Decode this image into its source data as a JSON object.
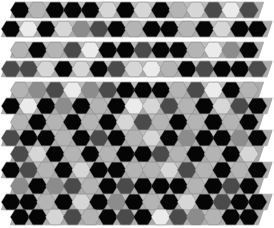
{
  "palette": {
    "K": "#050505",
    "D": "#4a4a4a",
    "G": "#8c8c8c",
    "L": "#b4b4b4",
    "V": "#d6d6d6",
    "W": "#ebebeb",
    "triangle": "#ababab",
    "edge": "#9a9a9a",
    "background": "#ffffff"
  },
  "geometry": {
    "hex_pitch": 17.6,
    "hex_radius": 9.6,
    "row_heights": 16
  },
  "strips": [
    {
      "y": 10,
      "x0": 20,
      "gap_after": true,
      "hexes": [
        "K",
        "L",
        "K",
        "K",
        "K",
        "V",
        "K",
        "V",
        "K",
        "L",
        "V",
        "D",
        "W",
        "D"
      ]
    },
    {
      "y": 29,
      "x0": 11,
      "gap_after": true,
      "hexes": [
        "K",
        "W",
        "K",
        "V",
        "G",
        "D",
        "K",
        "L",
        "K",
        "K",
        "L",
        "K",
        "V",
        "K",
        "K"
      ]
    },
    {
      "y": 50,
      "x0": 20,
      "gap_after": true,
      "hexes": [
        "L",
        "K",
        "L",
        "D",
        "W",
        "K",
        "K",
        "D",
        "K",
        "K",
        "L",
        "W",
        "G",
        "K"
      ]
    },
    {
      "y": 69,
      "x0": 11,
      "gap_after": true,
      "hexes": [
        "D",
        "D",
        "V",
        "K",
        "V",
        "K",
        "D",
        "V",
        "W",
        "L",
        "K",
        "D",
        "K",
        "K",
        "D"
      ]
    },
    {
      "y": 90,
      "x0": 20,
      "gap_after": false,
      "hexes": [
        "L",
        "G",
        "D",
        "W",
        "G",
        "D",
        "K",
        "K",
        "K",
        "L",
        "D",
        "W",
        "K",
        "L"
      ]
    },
    {
      "y": 106,
      "x0": 11,
      "gap_after": false,
      "hexes": [
        "K",
        "W",
        "K",
        "G",
        "K",
        "L",
        "K",
        "W",
        "V",
        "D",
        "L",
        "K",
        "V",
        "D",
        "K"
      ]
    },
    {
      "y": 122,
      "x0": 20,
      "gap_after": false,
      "hexes": [
        "L",
        "K",
        "L",
        "K",
        "L",
        "K",
        "V",
        "D",
        "L",
        "K",
        "L",
        "K",
        "L",
        "K"
      ]
    },
    {
      "y": 138,
      "x0": 11,
      "gap_after": false,
      "hexes": [
        "D",
        "K",
        "K",
        "L",
        "K",
        "D",
        "K",
        "L",
        "V",
        "K",
        "G",
        "K",
        "K",
        "G",
        "K"
      ]
    },
    {
      "y": 154,
      "x0": 20,
      "gap_after": false,
      "hexes": [
        "D",
        "V",
        "K",
        "L",
        "K",
        "L",
        "K",
        "K",
        "D",
        "L",
        "K",
        "L",
        "K",
        "V"
      ]
    },
    {
      "y": 170,
      "x0": 11,
      "gap_after": false,
      "hexes": [
        "K",
        "D",
        "L",
        "K",
        "V",
        "K",
        "K",
        "L",
        "L",
        "V",
        "D",
        "L",
        "K",
        "L",
        "K"
      ]
    },
    {
      "y": 186,
      "x0": 20,
      "gap_after": false,
      "hexes": [
        "G",
        "K",
        "G",
        "D",
        "L",
        "K",
        "D",
        "K",
        "K",
        "K",
        "L",
        "K",
        "D",
        "K"
      ]
    },
    {
      "y": 202,
      "x0": 11,
      "gap_after": false,
      "hexes": [
        "K",
        "K",
        "L",
        "K",
        "V",
        "K",
        "G",
        "K",
        "L",
        "K",
        "V",
        "K",
        "D",
        "K",
        "K"
      ]
    },
    {
      "y": 217,
      "x0": 20,
      "gap_after": false,
      "hexes": [
        "K",
        "K",
        "V",
        "D",
        "L",
        "K",
        "D",
        "K",
        "W",
        "D",
        "G",
        "L",
        "K",
        "K"
      ]
    }
  ]
}
